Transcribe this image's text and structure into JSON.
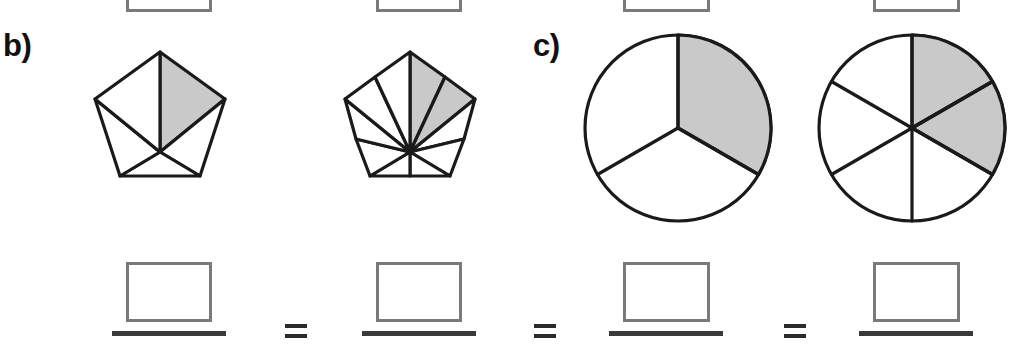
{
  "worksheet": {
    "title": "Equivalent fractions with shaded shapes",
    "background_color": "#ffffff",
    "outline_color": "#1a1a1a",
    "shade_color": "#c9c9c9",
    "box_border_color": "#7a7a7a",
    "bar_color": "#3a3a3a"
  },
  "top_row": {
    "description": "bottom edges of four answer boxes from the previous part, clipped by the top of the image",
    "boxes": [
      {
        "name": "box-a-1",
        "value": "",
        "placeholder": ""
      },
      {
        "name": "box-a-2",
        "value": "",
        "placeholder": ""
      },
      {
        "name": "box-a-3",
        "value": "",
        "placeholder": ""
      },
      {
        "name": "box-a-4",
        "value": "",
        "placeholder": ""
      }
    ]
  },
  "parts": [
    {
      "id": "b",
      "label": "b)",
      "figures": [
        {
          "name": "pentagon-fifths",
          "shape": "pentagon",
          "total_parts": 5,
          "shaded_parts": 1,
          "fraction": "1/5",
          "shaded_sector_indices": [
            0
          ]
        },
        {
          "name": "pentagon-tenths",
          "shape": "pentagon",
          "total_parts": 10,
          "shaded_parts": 2,
          "fraction": "2/10",
          "shaded_sector_indices": [
            0,
            1
          ]
        }
      ],
      "answers": [
        {
          "name": "numerator-box-b-1",
          "value": "",
          "denominator_bar": true
        },
        {
          "name": "numerator-box-b-2",
          "value": "",
          "denominator_bar": true
        }
      ],
      "operator": "="
    },
    {
      "id": "c",
      "label": "c)",
      "figures": [
        {
          "name": "circle-thirds",
          "shape": "circle",
          "total_parts": 3,
          "shaded_parts": 1,
          "fraction": "1/3",
          "shaded_sector_indices": [
            0
          ]
        },
        {
          "name": "circle-sixths",
          "shape": "circle",
          "total_parts": 6,
          "shaded_parts": 2,
          "fraction": "2/6",
          "shaded_sector_indices": [
            0,
            1
          ],
          "clipped": "right edge of image"
        }
      ],
      "answers": [
        {
          "name": "numerator-box-c-1",
          "value": "",
          "denominator_bar": true
        },
        {
          "name": "numerator-box-c-2",
          "value": "",
          "denominator_bar": true
        }
      ],
      "operator": "="
    }
  ]
}
